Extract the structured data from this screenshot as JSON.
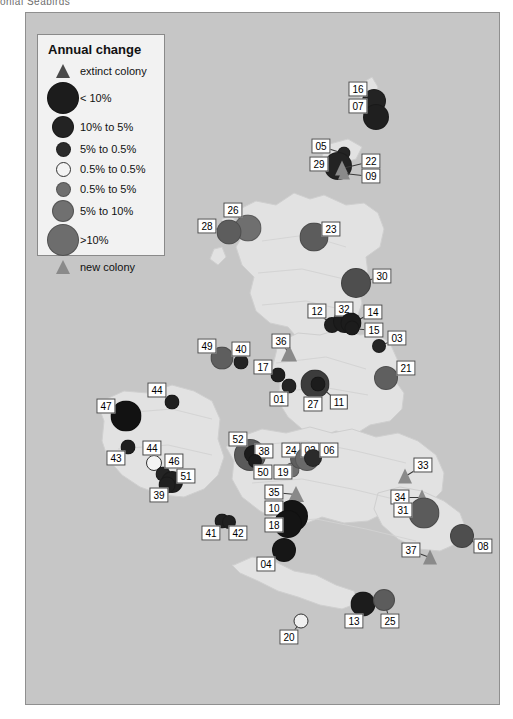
{
  "caption_fragment": "onial Seabirds",
  "legend": {
    "title": "Annual change",
    "rows": [
      {
        "symbol": "triangle",
        "label": "extinct colony",
        "size": 14,
        "color": "#4a4a4a"
      },
      {
        "symbol": "circle",
        "label": "< 10%",
        "size": 30,
        "color": "#1c1c1c"
      },
      {
        "symbol": "circle",
        "label": "10% to  5%",
        "size": 20,
        "color": "#232323"
      },
      {
        "symbol": "circle",
        "label": "5% to  0.5%",
        "size": 13,
        "color": "#2b2b2b"
      },
      {
        "symbol": "circle",
        "label": "0.5% to 0.5%",
        "size": 13,
        "color": "#f4f4f4"
      },
      {
        "symbol": "circle",
        "label": "0.5% to 5%",
        "size": 13,
        "color": "#6f6f6f"
      },
      {
        "symbol": "circle",
        "label": "5% to 10%",
        "size": 20,
        "color": "#707070"
      },
      {
        "symbol": "circle",
        "label": ">10%",
        "size": 30,
        "color": "#6d6d6d"
      },
      {
        "symbol": "triangle",
        "label": "new colony",
        "size": 14,
        "color": "#8a8a8a"
      }
    ]
  },
  "colors": {
    "sea": "#c6c6c6",
    "land": "#e2e2e2",
    "frame_border": "#8f8f8f",
    "legend_bg": "#f2f2f2",
    "label_bg": "#ffffff",
    "label_border": "#444444",
    "leader_line": "#3a3a3a",
    "decline_large": "#1c1c1c",
    "decline_mid": "#2b2b2b",
    "stable_open": "#f4f4f4",
    "increase_mid": "#6f6f6f",
    "increase_large": "#6d6d6d",
    "triangle_new": "#8a8a8a",
    "triangle_extinct": "#4a4a4a"
  },
  "map": {
    "title": "",
    "markers": [
      {
        "id": "16",
        "shape": "circle",
        "size": 22,
        "color": "#232323",
        "mx": 348,
        "my": 88,
        "lx": 332,
        "ly": 76
      },
      {
        "id": "07",
        "shape": "circle",
        "size": 24,
        "color": "#1f1f1f",
        "mx": 350,
        "my": 104,
        "lx": 332,
        "ly": 93
      },
      {
        "id": "05",
        "shape": "circle",
        "size": 11,
        "color": "#232323",
        "mx": 318,
        "my": 140,
        "lx": 295,
        "ly": 133
      },
      {
        "id": "29",
        "shape": "circle",
        "size": 26,
        "color": "#232323",
        "mx": 312,
        "my": 153,
        "lx": 293,
        "ly": 151
      },
      {
        "id": "22",
        "shape": "triangle",
        "size": 15,
        "color": "#8a8a8a",
        "mx": 316,
        "my": 155,
        "lx": 345,
        "ly": 148
      },
      {
        "id": "09",
        "shape": "triangle",
        "size": 13,
        "color": "#8a8a8a",
        "mx": 318,
        "my": 160,
        "lx": 345,
        "ly": 163
      },
      {
        "id": "26",
        "shape": "circle",
        "size": 25,
        "color": "#6f6f6f",
        "mx": 222,
        "my": 215,
        "lx": 207,
        "ly": 197
      },
      {
        "id": "28",
        "shape": "circle",
        "size": 23,
        "color": "#5d5d5d",
        "mx": 203,
        "my": 219,
        "lx": 181,
        "ly": 213
      },
      {
        "id": "23",
        "shape": "circle",
        "size": 27,
        "color": "#5c5c5c",
        "mx": 288,
        "my": 224,
        "lx": 305,
        "ly": 216
      },
      {
        "id": "30",
        "shape": "circle",
        "size": 28,
        "color": "#4e4e4e",
        "mx": 330,
        "my": 270,
        "lx": 356,
        "ly": 263
      },
      {
        "id": "12",
        "shape": "circle",
        "size": 14,
        "color": "#1f1f1f",
        "mx": 306,
        "my": 312,
        "lx": 291,
        "ly": 298
      },
      {
        "id": "32",
        "shape": "circle",
        "size": 22,
        "color": "#1c1c1c",
        "mx": 319,
        "my": 308,
        "lx": 318,
        "ly": 296
      },
      {
        "id": "14",
        "shape": "circle",
        "size": 19,
        "color": "#1c1c1c",
        "mx": 325,
        "my": 310,
        "lx": 347,
        "ly": 299
      },
      {
        "id": "15",
        "shape": "circle",
        "size": 13,
        "color": "#1c1c1c",
        "mx": 326,
        "my": 315,
        "lx": 348,
        "ly": 317
      },
      {
        "id": "03",
        "shape": "circle",
        "size": 12,
        "color": "#242424",
        "mx": 353,
        "my": 333,
        "lx": 371,
        "ly": 325
      },
      {
        "id": "21",
        "shape": "circle",
        "size": 22,
        "color": "#5f5f5f",
        "mx": 360,
        "my": 365,
        "lx": 380,
        "ly": 355
      },
      {
        "id": "49",
        "shape": "circle",
        "size": 21,
        "color": "#5e5e5e",
        "mx": 196,
        "my": 345,
        "lx": 181,
        "ly": 333
      },
      {
        "id": "40",
        "shape": "circle",
        "size": 13,
        "color": "#232323",
        "mx": 215,
        "my": 349,
        "lx": 215,
        "ly": 336
      },
      {
        "id": "36",
        "shape": "triangle",
        "size": 17,
        "color": "#8a8a8a",
        "mx": 263,
        "my": 340,
        "lx": 255,
        "ly": 328
      },
      {
        "id": "17",
        "shape": "circle",
        "size": 13,
        "color": "#1f1f1f",
        "mx": 252,
        "my": 362,
        "lx": 237,
        "ly": 354
      },
      {
        "id": "01",
        "shape": "circle",
        "size": 13,
        "color": "#242424",
        "mx": 263,
        "my": 373,
        "lx": 253,
        "ly": 386
      },
      {
        "id": "27",
        "shape": "circle",
        "size": 27,
        "color": "#3c3c3c",
        "mx": 289,
        "my": 371,
        "lx": 287,
        "ly": 391
      },
      {
        "id": "11",
        "shape": "circle",
        "size": 13,
        "color": "#1c1c1c",
        "mx": 292,
        "my": 371,
        "lx": 313,
        "ly": 389
      },
      {
        "id": "47",
        "shape": "circle",
        "size": 29,
        "color": "#121212",
        "mx": 100,
        "my": 403,
        "lx": 80,
        "ly": 393
      },
      {
        "id": "44",
        "shape": "circle",
        "size": 13,
        "color": "#1f1f1f",
        "mx": 146,
        "my": 389,
        "lx": 131,
        "ly": 377
      },
      {
        "id": "43",
        "shape": "circle",
        "size": 13,
        "color": "#1f1f1f",
        "mx": 102,
        "my": 434,
        "lx": 90,
        "ly": 445
      },
      {
        "id": "44b",
        "shape": "circle",
        "size": 14,
        "color": "#f4f4f4",
        "mx": 128,
        "my": 450,
        "lx": 126,
        "ly": 435,
        "label": "44"
      },
      {
        "id": "46",
        "shape": "circle",
        "size": 13,
        "color": "#242424",
        "mx": 137,
        "my": 461,
        "lx": 148,
        "ly": 448
      },
      {
        "id": "51",
        "shape": "circle",
        "size": 20,
        "color": "#1f1f1f",
        "mx": 146,
        "my": 469,
        "lx": 160,
        "ly": 463
      },
      {
        "id": "39",
        "shape": "circle",
        "size": 15,
        "color": "#1f1f1f",
        "mx": 141,
        "my": 472,
        "lx": 133,
        "ly": 482
      },
      {
        "id": "52",
        "shape": "circle",
        "size": 30,
        "color": "#5a5a5a",
        "mx": 224,
        "my": 442,
        "lx": 212,
        "ly": 426
      },
      {
        "id": "38",
        "shape": "circle",
        "size": 16,
        "color": "#1c1c1c",
        "mx": 227,
        "my": 441,
        "lx": 238,
        "ly": 438
      },
      {
        "id": "50",
        "shape": "circle",
        "size": 12,
        "color": "#1c1c1c",
        "mx": 229,
        "my": 448,
        "lx": 237,
        "ly": 459
      },
      {
        "id": "19",
        "shape": "circle",
        "size": 13,
        "color": "#6f6f6f",
        "mx": 266,
        "my": 457,
        "lx": 257,
        "ly": 459
      },
      {
        "id": "24",
        "shape": "circle",
        "size": 18,
        "color": "#5f5f5f",
        "mx": 274,
        "my": 446,
        "lx": 265,
        "ly": 437
      },
      {
        "id": "02",
        "shape": "circle",
        "size": 22,
        "color": "#6a6a6a",
        "mx": 281,
        "my": 446,
        "lx": 284,
        "ly": 437
      },
      {
        "id": "06",
        "shape": "circle",
        "size": 16,
        "color": "#2b2b2b",
        "mx": 287,
        "my": 445,
        "lx": 303,
        "ly": 437
      },
      {
        "id": "35",
        "shape": "triangle",
        "size": 16,
        "color": "#8a8a8a",
        "mx": 270,
        "my": 481,
        "lx": 248,
        "ly": 479
      },
      {
        "id": "10",
        "shape": "circle",
        "size": 30,
        "color": "#141414",
        "mx": 266,
        "my": 503,
        "lx": 248,
        "ly": 495
      },
      {
        "id": "18",
        "shape": "circle",
        "size": 26,
        "color": "#141414",
        "mx": 262,
        "my": 511,
        "lx": 248,
        "ly": 512
      },
      {
        "id": "41",
        "shape": "circle",
        "size": 13,
        "color": "#1f1f1f",
        "mx": 196,
        "my": 508,
        "lx": 185,
        "ly": 520
      },
      {
        "id": "42",
        "shape": "circle",
        "size": 12,
        "color": "#1f1f1f",
        "mx": 203,
        "my": 509,
        "lx": 212,
        "ly": 520
      },
      {
        "id": "04",
        "shape": "circle",
        "size": 22,
        "color": "#161616",
        "mx": 258,
        "my": 537,
        "lx": 240,
        "ly": 551
      },
      {
        "id": "33",
        "shape": "triangle",
        "size": 15,
        "color": "#8a8a8a",
        "mx": 379,
        "my": 463,
        "lx": 397,
        "ly": 452
      },
      {
        "id": "34",
        "shape": "triangle",
        "size": 15,
        "color": "#8a8a8a",
        "mx": 396,
        "my": 484,
        "lx": 374,
        "ly": 484
      },
      {
        "id": "31",
        "shape": "circle",
        "size": 29,
        "color": "#5b5b5b",
        "mx": 398,
        "my": 500,
        "lx": 377,
        "ly": 497
      },
      {
        "id": "37",
        "shape": "triangle",
        "size": 15,
        "color": "#8a8a8a",
        "mx": 404,
        "my": 544,
        "lx": 385,
        "ly": 537
      },
      {
        "id": "08",
        "shape": "circle",
        "size": 22,
        "color": "#4e4e4e",
        "mx": 436,
        "my": 523,
        "lx": 457,
        "ly": 533
      },
      {
        "id": "13",
        "shape": "circle",
        "size": 23,
        "color": "#1c1c1c",
        "mx": 337,
        "my": 591,
        "lx": 328,
        "ly": 608
      },
      {
        "id": "25",
        "shape": "circle",
        "size": 20,
        "color": "#5c5c5c",
        "mx": 358,
        "my": 587,
        "lx": 364,
        "ly": 608
      },
      {
        "id": "20",
        "shape": "circle",
        "size": 13,
        "color": "#f0f0f0",
        "mx": 275,
        "my": 608,
        "lx": 263,
        "ly": 624
      }
    ]
  }
}
